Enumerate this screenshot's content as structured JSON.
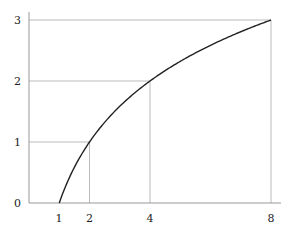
{
  "chart_data": {
    "type": "line",
    "title": "",
    "xlabel": "",
    "ylabel": "",
    "function": "y = log2(x)",
    "x": [
      1,
      1.5,
      2,
      3,
      4,
      5,
      6,
      7,
      8
    ],
    "series": [
      {
        "name": "log2(x)",
        "values": [
          0,
          0.585,
          1,
          1.585,
          2,
          2.322,
          2.585,
          2.807,
          3
        ]
      }
    ],
    "x_ticks": [
      "1",
      "2",
      "4",
      "8"
    ],
    "y_ticks": [
      "0",
      "1",
      "2",
      "3"
    ],
    "xlim": [
      0,
      8.3
    ],
    "ylim": [
      0,
      3.13
    ],
    "grid": false,
    "reference_lines": [
      {
        "x": 2,
        "y": 1
      },
      {
        "x": 4,
        "y": 2
      },
      {
        "x": 8,
        "y": 3
      }
    ],
    "colors": {
      "curve": "#222222",
      "guides": "#aaaaaa",
      "axes": "#999999"
    }
  }
}
